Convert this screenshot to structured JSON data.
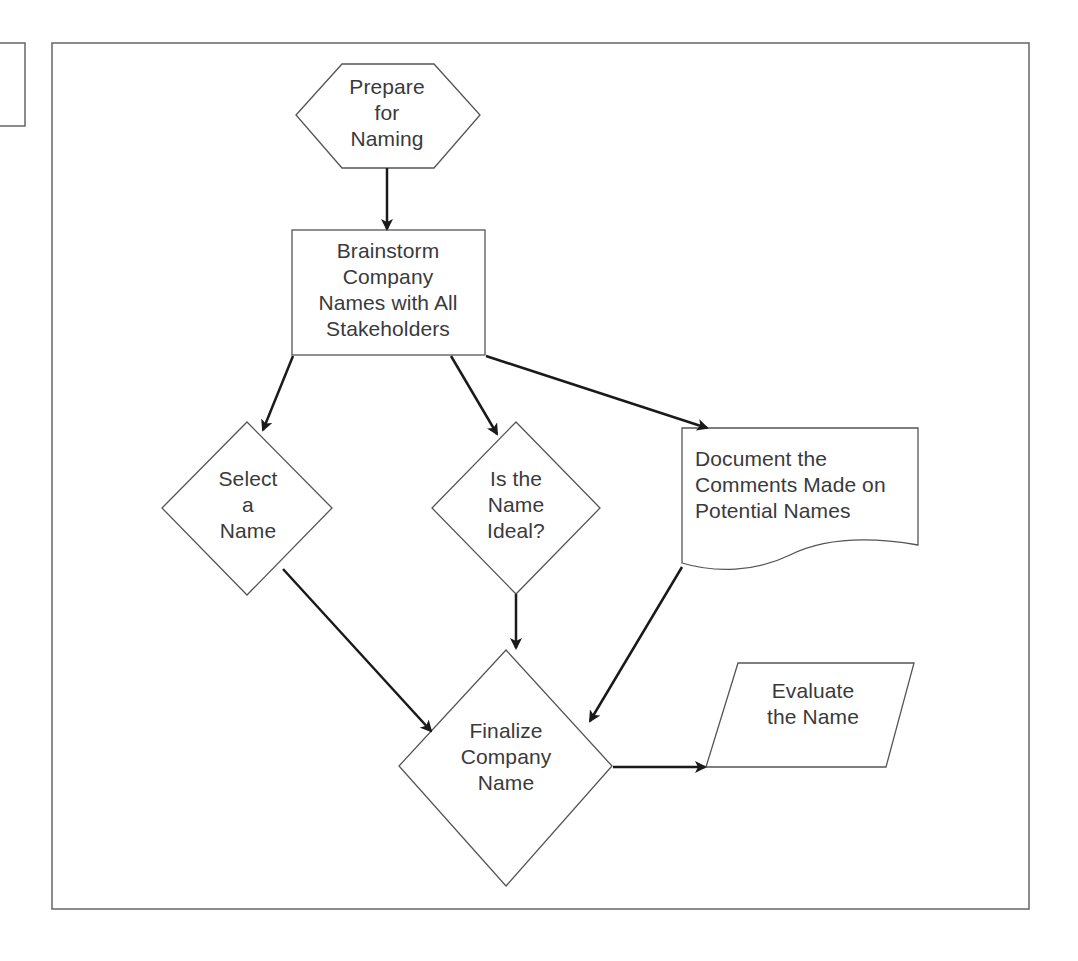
{
  "diagram": {
    "type": "flowchart",
    "colors": {
      "stroke": "#555555",
      "arrow": "#1a1a1a",
      "text": "#3a3a3a",
      "background": "#ffffff"
    },
    "nodes": [
      {
        "id": "prepare",
        "shape": "hexagon",
        "lines": [
          "Prepare",
          "for",
          "Naming"
        ]
      },
      {
        "id": "brainstorm",
        "shape": "rectangle",
        "lines": [
          "Brainstorm",
          "Company",
          "Names with All",
          "Stakeholders"
        ]
      },
      {
        "id": "select",
        "shape": "diamond",
        "lines": [
          "Select",
          "a",
          "Name"
        ]
      },
      {
        "id": "ideal",
        "shape": "diamond",
        "lines": [
          "Is the",
          "Name",
          "Ideal?"
        ]
      },
      {
        "id": "document",
        "shape": "document",
        "lines": [
          "Document the",
          "Comments Made on",
          "Potential Names"
        ]
      },
      {
        "id": "finalize",
        "shape": "diamond",
        "lines": [
          "Finalize",
          "Company",
          "Name"
        ]
      },
      {
        "id": "evaluate",
        "shape": "parallelogram",
        "lines": [
          "Evaluate",
          "the Name"
        ]
      }
    ],
    "edges": [
      {
        "from": "prepare",
        "to": "brainstorm"
      },
      {
        "from": "brainstorm",
        "to": "select"
      },
      {
        "from": "brainstorm",
        "to": "ideal"
      },
      {
        "from": "brainstorm",
        "to": "document"
      },
      {
        "from": "select",
        "to": "finalize"
      },
      {
        "from": "ideal",
        "to": "finalize"
      },
      {
        "from": "document",
        "to": "finalize"
      },
      {
        "from": "finalize",
        "to": "evaluate"
      }
    ]
  }
}
